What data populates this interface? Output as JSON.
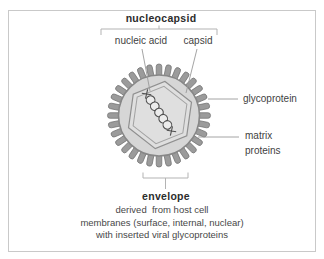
{
  "diagram": {
    "nucleocapsid_label": "nucleocapsid",
    "nucleic_acid_label": "nucleic acid",
    "capsid_label": "capsid",
    "glycoprotein_label": "glycoprotein",
    "matrix_proteins_label": "matrix\nproteins",
    "envelope_label": "envelope",
    "caption_lines": [
      "derived  from host cell",
      "membranes (surface, internal, nuclear)",
      "with inserted viral glycoproteins"
    ],
    "colors": {
      "spike_fill": "#9b9b9b",
      "spike_edge": "#6f6f6f",
      "envelope_fill": "#d6d6d6",
      "envelope_rim": "#878787",
      "capsid_fill": "#dfdfdf",
      "capsid_line": "#8f8f8f",
      "capsid_inner_line": "#a2a2a2",
      "helix_line": "#4f4f4f",
      "helix_fill": "#ececec",
      "pointer_line": "#9a9a9a",
      "bracket_line": "#b3b3b3",
      "frame_border": "#c9c9c9",
      "text": "#3f3f3f"
    }
  }
}
